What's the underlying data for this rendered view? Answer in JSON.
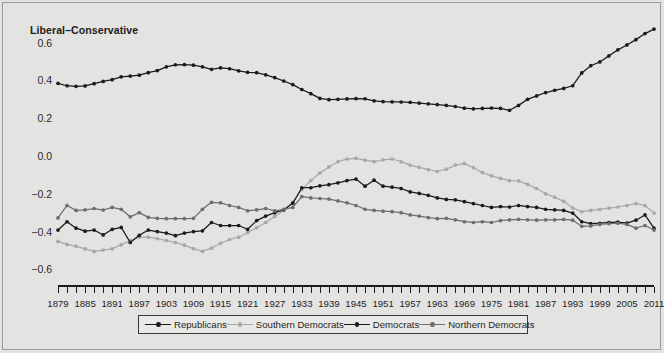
{
  "chart_data": {
    "type": "line",
    "title": "",
    "ylabel": "Liberal–Conservative",
    "xlabel": "",
    "ylim": [
      -0.72,
      0.72
    ],
    "xlim": [
      1879,
      2011
    ],
    "grid": false,
    "legend_position": "bottom",
    "yticks": [
      0.6,
      0.4,
      0.2,
      0.0,
      -0.2,
      -0.4,
      -0.6
    ],
    "ytick_labels": [
      "0.6",
      "0.4",
      "0.2",
      "0.0",
      "−0.2",
      "−0.4",
      "−0.6"
    ],
    "xtick_labels": [
      "1879",
      "1885",
      "1891",
      "1897",
      "1903",
      "1909",
      "1915",
      "1921",
      "1927",
      "1933",
      "1939",
      "1945",
      "1951",
      "1957",
      "1963",
      "1969",
      "1975",
      "1981",
      "1987",
      "1993",
      "1999",
      "2005",
      "2011"
    ],
    "x_tick_step_years": 2,
    "x_label_step_years": 6,
    "x": [
      1879,
      1881,
      1883,
      1885,
      1887,
      1889,
      1891,
      1893,
      1895,
      1897,
      1899,
      1901,
      1903,
      1905,
      1907,
      1909,
      1911,
      1913,
      1915,
      1917,
      1919,
      1921,
      1923,
      1925,
      1927,
      1929,
      1931,
      1933,
      1935,
      1937,
      1939,
      1941,
      1943,
      1945,
      1947,
      1949,
      1951,
      1953,
      1955,
      1957,
      1959,
      1961,
      1963,
      1965,
      1967,
      1969,
      1971,
      1973,
      1975,
      1977,
      1979,
      1981,
      1983,
      1985,
      1987,
      1989,
      1991,
      1993,
      1995,
      1997,
      1999,
      2001,
      2003,
      2005,
      2007,
      2009,
      2011
    ],
    "series": [
      {
        "name": "Republicans",
        "color": "#1b1b1b",
        "values": [
          0.385,
          0.372,
          0.369,
          0.371,
          0.383,
          0.395,
          0.404,
          0.419,
          0.423,
          0.428,
          0.441,
          0.452,
          0.472,
          0.483,
          0.484,
          0.481,
          0.472,
          0.459,
          0.467,
          0.462,
          0.451,
          0.443,
          0.441,
          0.43,
          0.415,
          0.397,
          0.378,
          0.352,
          0.33,
          0.305,
          0.298,
          0.3,
          0.302,
          0.304,
          0.303,
          0.292,
          0.288,
          0.287,
          0.286,
          0.284,
          0.28,
          0.276,
          0.272,
          0.268,
          0.262,
          0.253,
          0.25,
          0.252,
          0.254,
          0.252,
          0.242,
          0.268,
          0.3,
          0.318,
          0.336,
          0.348,
          0.358,
          0.372,
          0.44,
          0.478,
          0.498,
          0.53,
          0.562,
          0.588,
          0.616,
          0.648,
          0.672
        ]
      },
      {
        "name": "Southern Democrats",
        "color": "#a8a8a6",
        "values": [
          -0.452,
          -0.468,
          -0.478,
          -0.492,
          -0.505,
          -0.498,
          -0.492,
          -0.47,
          -0.448,
          -0.43,
          -0.43,
          -0.438,
          -0.448,
          -0.458,
          -0.472,
          -0.49,
          -0.505,
          -0.488,
          -0.462,
          -0.442,
          -0.43,
          -0.406,
          -0.38,
          -0.352,
          -0.32,
          -0.288,
          -0.245,
          -0.178,
          -0.13,
          -0.09,
          -0.058,
          -0.03,
          -0.016,
          -0.012,
          -0.022,
          -0.03,
          -0.02,
          -0.016,
          -0.03,
          -0.048,
          -0.06,
          -0.072,
          -0.082,
          -0.07,
          -0.048,
          -0.04,
          -0.062,
          -0.088,
          -0.105,
          -0.118,
          -0.13,
          -0.132,
          -0.15,
          -0.172,
          -0.2,
          -0.218,
          -0.24,
          -0.275,
          -0.295,
          -0.288,
          -0.283,
          -0.276,
          -0.27,
          -0.262,
          -0.252,
          -0.262,
          -0.302
        ]
      },
      {
        "name": "Democrats",
        "color": "#1b1b1b",
        "values": [
          -0.392,
          -0.348,
          -0.382,
          -0.398,
          -0.392,
          -0.418,
          -0.388,
          -0.378,
          -0.458,
          -0.42,
          -0.392,
          -0.4,
          -0.408,
          -0.422,
          -0.408,
          -0.4,
          -0.396,
          -0.352,
          -0.368,
          -0.368,
          -0.368,
          -0.388,
          -0.342,
          -0.318,
          -0.3,
          -0.285,
          -0.25,
          -0.168,
          -0.168,
          -0.158,
          -0.152,
          -0.142,
          -0.13,
          -0.122,
          -0.16,
          -0.128,
          -0.16,
          -0.165,
          -0.172,
          -0.19,
          -0.198,
          -0.208,
          -0.222,
          -0.23,
          -0.232,
          -0.242,
          -0.252,
          -0.262,
          -0.272,
          -0.268,
          -0.27,
          -0.262,
          -0.268,
          -0.272,
          -0.282,
          -0.285,
          -0.288,
          -0.302,
          -0.348,
          -0.358,
          -0.356,
          -0.352,
          -0.35,
          -0.355,
          -0.34,
          -0.312,
          -0.382
        ]
      },
      {
        "name": "Northern Democrats",
        "color": "#6e6e6c",
        "values": [
          -0.328,
          -0.262,
          -0.288,
          -0.285,
          -0.278,
          -0.286,
          -0.272,
          -0.282,
          -0.322,
          -0.3,
          -0.325,
          -0.33,
          -0.332,
          -0.332,
          -0.332,
          -0.33,
          -0.282,
          -0.245,
          -0.248,
          -0.262,
          -0.272,
          -0.29,
          -0.285,
          -0.278,
          -0.29,
          -0.282,
          -0.272,
          -0.215,
          -0.222,
          -0.225,
          -0.228,
          -0.238,
          -0.248,
          -0.262,
          -0.282,
          -0.288,
          -0.292,
          -0.295,
          -0.3,
          -0.312,
          -0.318,
          -0.326,
          -0.332,
          -0.33,
          -0.338,
          -0.348,
          -0.352,
          -0.348,
          -0.352,
          -0.342,
          -0.338,
          -0.335,
          -0.338,
          -0.34,
          -0.338,
          -0.338,
          -0.336,
          -0.34,
          -0.372,
          -0.37,
          -0.362,
          -0.358,
          -0.356,
          -0.362,
          -0.382,
          -0.368,
          -0.392
        ]
      }
    ]
  },
  "legend": {
    "items": [
      {
        "label": "Republicans",
        "color": "#1b1b1b"
      },
      {
        "label": "Southern Democrats",
        "color": "#a8a8a6"
      },
      {
        "label": "Democrats",
        "color": "#1b1b1b"
      },
      {
        "label": "Northern Democrats",
        "color": "#6e6e6c"
      }
    ]
  },
  "colors": {
    "background": "#e3e3e1",
    "axis": "#1b1b1b",
    "text": "#1f1f1f"
  }
}
